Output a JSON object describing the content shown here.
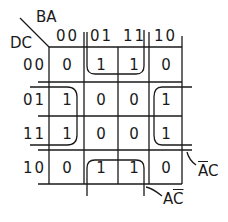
{
  "kmap": {
    "col_var_label": "BA",
    "row_var_label": "DC",
    "col_headers": [
      "00",
      "01",
      "11",
      "10"
    ],
    "row_headers": [
      "00",
      "01",
      "11",
      "10"
    ],
    "cells": [
      [
        "0",
        "1",
        "1",
        "0"
      ],
      [
        "1",
        "0",
        "0",
        "1"
      ],
      [
        "1",
        "0",
        "0",
        "1"
      ],
      [
        "0",
        "1",
        "1",
        "0"
      ]
    ],
    "groups": [
      {
        "term": "ĀC",
        "bar_on": "A",
        "cells": "rows 01,11 × cols 00,10 (wrap)"
      },
      {
        "term": "AC̄",
        "bar_on": "C",
        "cells": "rows 00,10 × cols 01,11 (wrap)"
      }
    ],
    "term_labels": {
      "a_not_c": {
        "letter1": "A",
        "letter2": "C",
        "bar": "first"
      },
      "a_c_not": {
        "letter1": "A",
        "letter2": "C",
        "bar": "second"
      }
    }
  }
}
